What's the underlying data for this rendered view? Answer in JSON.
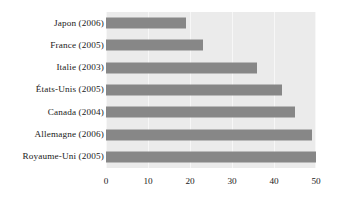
{
  "chart_data": {
    "type": "bar",
    "orientation": "horizontal",
    "title": "",
    "xlabel": "",
    "ylabel": "",
    "categories": [
      "Japon (2006)",
      "France (2005)",
      "Italie (2003)",
      "États-Unis (2005)",
      "Canada (2004)",
      "Allemagne (2006)",
      "Royaume-Uni (2005)"
    ],
    "values": [
      19,
      23,
      36,
      42,
      45,
      49,
      50
    ],
    "xlim": [
      0,
      50
    ],
    "xticks": [
      0,
      10,
      20,
      30,
      40,
      50
    ],
    "xtick_labels": [
      "0",
      "10",
      "20",
      "30",
      "40",
      "50"
    ],
    "grid": true,
    "legend": false,
    "bar_color": "#878787",
    "panel_color": "#ebebeb",
    "grid_color": "#f7f7f7",
    "text_color": "#1a1a1a",
    "background": "#ffffff"
  }
}
